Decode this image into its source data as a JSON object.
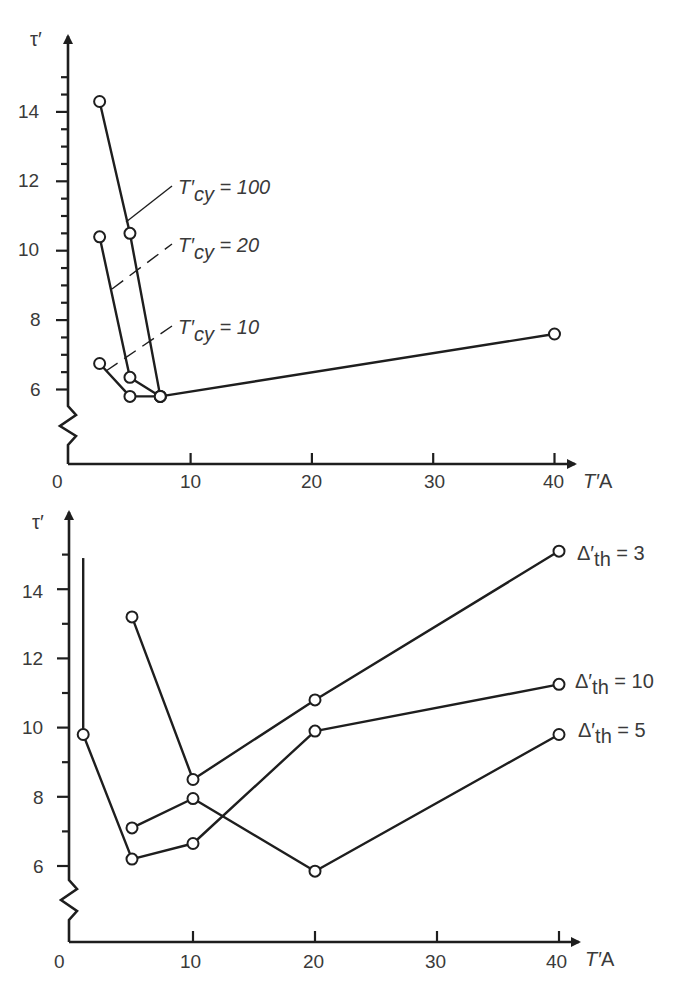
{
  "chart_data": [
    {
      "type": "line",
      "title": "",
      "xlabel": "T'A",
      "ylabel": "τ'",
      "xlim": [
        0,
        42
      ],
      "ylim": [
        5,
        15.5
      ],
      "y_axis_break": true,
      "grid": false,
      "x_ticks": [
        0,
        10,
        20,
        30,
        40
      ],
      "y_ticks": [
        6,
        8,
        10,
        12,
        14
      ],
      "legend_position": "inline labels with leader lines",
      "series": [
        {
          "name": "T'cy = 100",
          "label_prefix": "T'",
          "label_sub": "cy",
          "label_suffix": " = 100",
          "points": [
            [
              2.5,
              14.3
            ],
            [
              5,
              10.5
            ],
            [
              7.5,
              5.8
            ],
            [
              40,
              7.6
            ]
          ]
        },
        {
          "name": "T'cy = 20",
          "label_prefix": "T'",
          "label_sub": "cy",
          "label_suffix": " = 20",
          "points": [
            [
              2.5,
              10.4
            ],
            [
              5,
              6.35
            ],
            [
              7.5,
              5.8
            ]
          ]
        },
        {
          "name": "T'cy = 10",
          "label_prefix": "T'",
          "label_sub": "cy",
          "label_suffix": " = 10",
          "points": [
            [
              2.5,
              6.75
            ],
            [
              5,
              5.8
            ],
            [
              7.5,
              5.8
            ]
          ]
        }
      ]
    },
    {
      "type": "line",
      "title": "",
      "xlabel": "T'A",
      "ylabel": "τ'",
      "xlim": [
        0,
        42
      ],
      "ylim": [
        5,
        16
      ],
      "y_axis_break": true,
      "grid": false,
      "x_ticks": [
        0,
        10,
        20,
        30,
        40
      ],
      "y_ticks": [
        6,
        8,
        10,
        12,
        14
      ],
      "legend_position": "right, at line ends",
      "series": [
        {
          "name": "Δ'th = 3",
          "label_prefix": "Δ'",
          "label_sub": "th",
          "label_suffix": " = 3",
          "points": [
            [
              5,
              13.2
            ],
            [
              10,
              8.5
            ],
            [
              20,
              10.8
            ],
            [
              40,
              15.1
            ]
          ]
        },
        {
          "name": "Δ'th = 10",
          "label_prefix": "Δ'",
          "label_sub": "th",
          "label_suffix": " = 10",
          "points": [
            [
              1,
              9.8
            ],
            [
              5,
              6.2
            ],
            [
              10,
              6.65
            ],
            [
              20,
              9.9
            ],
            [
              40,
              11.25
            ]
          ],
          "vertical_segment": {
            "x": 1,
            "y_from": 9.8,
            "y_to": 14.9
          }
        },
        {
          "name": "Δ'th = 5",
          "label_prefix": "Δ'",
          "label_sub": "th",
          "label_suffix": " = 5",
          "points": [
            [
              5,
              7.1
            ],
            [
              10,
              7.95
            ],
            [
              20,
              5.85
            ],
            [
              40,
              9.8
            ]
          ]
        }
      ]
    }
  ],
  "labels": {
    "top": {
      "y_axis": "τ′",
      "x_axis_italic": "T′",
      "x_axis_rest": "A",
      "origin": "0",
      "x_tick_labels": [
        "10",
        "20",
        "30",
        "40"
      ],
      "y_tick_labels": [
        "14",
        "12",
        "10",
        "8",
        "6"
      ],
      "series_labels": [
        {
          "prefix": "T′",
          "sub": "cy",
          "suffix": " = 100"
        },
        {
          "prefix": "T′",
          "sub": "cy",
          "suffix": " = 20"
        },
        {
          "prefix": "T′",
          "sub": "cy",
          "suffix": " = 10"
        }
      ]
    },
    "bottom": {
      "y_axis": "τ′",
      "x_axis_italic": "T′",
      "x_axis_rest": "A",
      "origin": "0",
      "x_tick_labels": [
        "10",
        "20",
        "30",
        "40"
      ],
      "y_tick_labels": [
        "14",
        "12",
        "10",
        "8",
        "6"
      ],
      "series_labels": [
        {
          "prefix": "Δ′",
          "sub": "th",
          "suffix": " = 3"
        },
        {
          "prefix": "Δ′",
          "sub": "th",
          "suffix": " = 10"
        },
        {
          "prefix": "Δ′",
          "sub": "th",
          "suffix": " = 5"
        }
      ]
    }
  }
}
